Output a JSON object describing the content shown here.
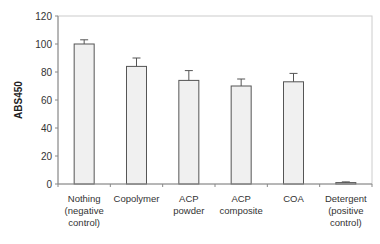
{
  "chart_data": {
    "type": "bar",
    "title": "",
    "xlabel": "",
    "ylabel": "ABS450",
    "ylim": [
      0,
      120
    ],
    "yticks": [
      0,
      20,
      40,
      60,
      80,
      100,
      120
    ],
    "grid": false,
    "legend": null,
    "categories": [
      [
        "Nothing",
        "(negative",
        "control)"
      ],
      [
        "Copolymer"
      ],
      [
        "ACP",
        "powder"
      ],
      [
        "ACP",
        "composite"
      ],
      [
        "COA"
      ],
      [
        "Detergent",
        "(positive",
        "control)"
      ]
    ],
    "category_names": [
      "Nothing (negative control)",
      "Copolymer",
      "ACP powder",
      "ACP composite",
      "COA",
      "Detergent (positive control)"
    ],
    "values": [
      100,
      84,
      74,
      70,
      73,
      1
    ],
    "error_plus": [
      3,
      6,
      7,
      5,
      6,
      0.5
    ],
    "colors": {
      "bar_fill": "#f0f0f0",
      "bar_stroke": "#555555",
      "axis": "#888888",
      "frame": "#cccccc"
    }
  }
}
